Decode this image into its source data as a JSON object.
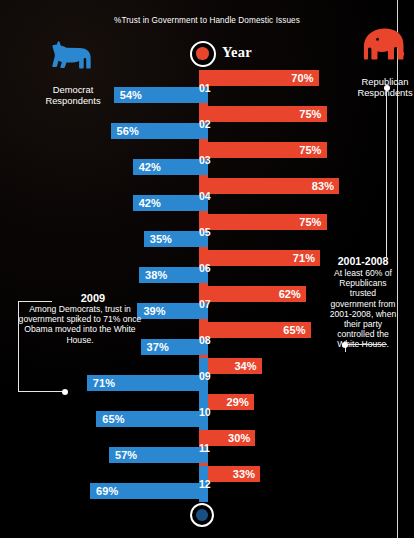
{
  "title": "%Trust in Government to Handle Domestic Issues",
  "axis": {
    "year_label": "Year"
  },
  "parties": {
    "democrat": {
      "name": "Democrat\nRespondents",
      "line1": "Democrat",
      "line2": "Respondents",
      "icon": "donkey-icon",
      "color": "#2a87d0"
    },
    "republican": {
      "name": "Republican\nRespondents",
      "line1": "Republican",
      "line2": "Respondents",
      "icon": "elephant-icon",
      "color": "#e8452c"
    }
  },
  "callouts": {
    "left": {
      "heading": "2009",
      "body": "Among Democrats, trust in government spiked to 71% once Obama moved into the White House."
    },
    "right": {
      "heading": "2001-2008",
      "body": "At least 60% of Republicans trusted government from 2001-2008, when their party controlled the White House."
    }
  },
  "chart_data": {
    "type": "bar",
    "title": "%Trust in Government to Handle Domestic Issues",
    "xlabel": "",
    "ylabel": "Year",
    "orientation": "horizontal-diverging",
    "categories": [
      "01",
      "02",
      "03",
      "04",
      "05",
      "06",
      "07",
      "08",
      "09",
      "10",
      "11",
      "12"
    ],
    "series": [
      {
        "name": "Democrat Respondents",
        "color": "#2a87d0",
        "direction": "left",
        "values": [
          54,
          56,
          42,
          42,
          35,
          38,
          39,
          37,
          71,
          65,
          57,
          69
        ],
        "labels": [
          "54%",
          "56%",
          "42%",
          "42%",
          "35%",
          "38%",
          "39%",
          "37%",
          "71%",
          "65%",
          "57%",
          "69%"
        ]
      },
      {
        "name": "Republican Respondents",
        "color": "#e8452c",
        "direction": "right",
        "values": [
          70,
          75,
          75,
          83,
          75,
          71,
          62,
          65,
          34,
          29,
          30,
          33
        ],
        "labels": [
          "70%",
          "75%",
          "75%",
          "83%",
          "75%",
          "71%",
          "62%",
          "65%",
          "34%",
          "29%",
          "30%",
          "33%"
        ]
      }
    ],
    "xlim": [
      0,
      100
    ],
    "grid": false,
    "legend_position": "top-corners",
    "annotations": [
      {
        "target_year": "09",
        "side": "left",
        "heading": "2009",
        "text": "Among Democrats, trust in government spiked to 71% once Obama moved into the White House."
      },
      {
        "target_years": [
          "01",
          "08"
        ],
        "side": "right",
        "heading": "2001-2008",
        "text": "At least 60% of Republicans trusted government from 2001-2008, when their party controlled the White House."
      }
    ]
  }
}
